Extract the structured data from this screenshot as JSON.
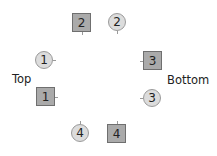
{
  "labels": {
    "left": "Top",
    "right": "Bottom"
  },
  "nodes": [
    {
      "id": "square-2",
      "shape": "square",
      "text": "2",
      "x": 72,
      "y": 13,
      "tick": "bottom"
    },
    {
      "id": "circle-2",
      "shape": "circle",
      "text": "2",
      "x": 108,
      "y": 13,
      "tick": "bottom"
    },
    {
      "id": "circle-1",
      "shape": "circle",
      "text": "1",
      "x": 35,
      "y": 51,
      "tick": "right"
    },
    {
      "id": "square-1",
      "shape": "square",
      "text": "1",
      "x": 36,
      "y": 87,
      "tick": "right"
    },
    {
      "id": "square-3",
      "shape": "square",
      "text": "3",
      "x": 143,
      "y": 51,
      "tick": "left"
    },
    {
      "id": "circle-3",
      "shape": "circle",
      "text": "3",
      "x": 143,
      "y": 89,
      "tick": "left"
    },
    {
      "id": "circle-4",
      "shape": "circle",
      "text": "4",
      "x": 71,
      "y": 124,
      "tick": "top"
    },
    {
      "id": "square-4",
      "shape": "square",
      "text": "4",
      "x": 107,
      "y": 124,
      "tick": "top"
    }
  ],
  "colors": {
    "square_fill": "#aaaaaa",
    "square_border": "#6f6f6f",
    "circle_fill": "#dcdcdc",
    "circle_border": "#9a9a9a"
  }
}
